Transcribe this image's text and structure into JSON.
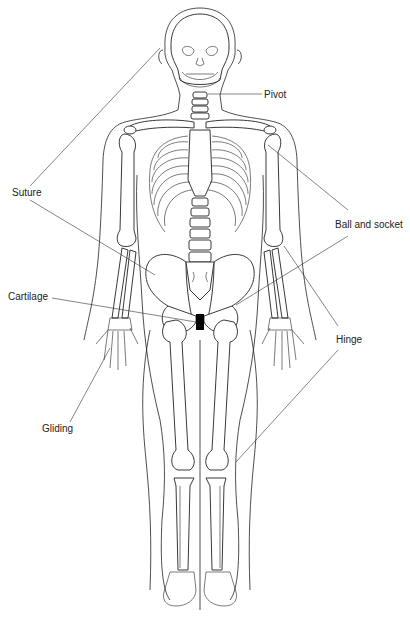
{
  "diagram": {
    "labels": {
      "pivot": "Pivot",
      "suture": "Suture",
      "ball_and_socket": "Ball and socket",
      "cartilage": "Cartilage",
      "hinge": "Hinge",
      "gliding": "Gliding"
    },
    "colors": {
      "line": "#222222",
      "background": "#ffffff",
      "cartilage_fill": "#000000"
    }
  }
}
